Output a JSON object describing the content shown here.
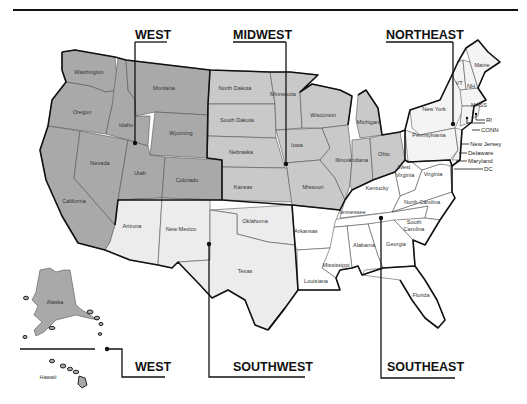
{
  "map": {
    "type": "US regions map",
    "colors": {
      "west": "#a9a9a9",
      "midwest": "#c9c9c9",
      "southwest": "#ececec",
      "northeast": "#f4f4f4",
      "southeast": "#ffffff",
      "border": "#111111"
    },
    "regions": {
      "west": "WEST",
      "midwest": "MIDWEST",
      "northeast": "NORTHEAST",
      "southwest": "SOUTHWEST",
      "southeast": "SOUTHEAST",
      "west_insets": "WEST"
    },
    "states": {
      "washington": "Washington",
      "oregon": "Oregon",
      "california": "California",
      "nevada": "Nevada",
      "idaho": "Idaho",
      "montana": "Montana",
      "wyoming": "Wyoming",
      "utah": "Utah",
      "colorado": "Colorado",
      "alaska": "Alaska",
      "hawaii": "Hawaii",
      "north_dakota": "North Dakota",
      "south_dakota": "South Dakota",
      "nebraska": "Nebraska",
      "kansas": "Kansas",
      "minnesota": "Minnesota",
      "iowa": "Iowa",
      "missouri": "Missouri",
      "wisconsin": "Wisconsin",
      "illinois": "Illinois",
      "michigan": "Michigan",
      "indiana": "Indiana",
      "ohio": "Ohio",
      "arizona": "Arizona",
      "new_mexico": "New Mexico",
      "oklahoma": "Oklahoma",
      "texas": "Texas",
      "maine": "Maine",
      "vt": "VT",
      "nh": "NH",
      "mass": "MASS",
      "ri": "RI",
      "conn": "CONN",
      "new_york": "New York",
      "pennsylvania": "Pennsylvania",
      "new_jersey": "New Jersey",
      "delaware": "Delaware",
      "maryland": "Maryland",
      "dc": "DC",
      "west_virginia_1": "West",
      "west_virginia_2": "Virginia",
      "virginia": "Virginia",
      "kentucky": "Kentucky",
      "tennessee": "Tennessee",
      "north_carolina": "North Carolina",
      "south_carolina_1": "South",
      "south_carolina_2": "Carolina",
      "georgia": "Georgia",
      "alabama": "Alabama",
      "mississippi": "Mississippi",
      "arkansas": "Arkansas",
      "louisiana": "Louisiana",
      "florida": "Florida"
    }
  }
}
